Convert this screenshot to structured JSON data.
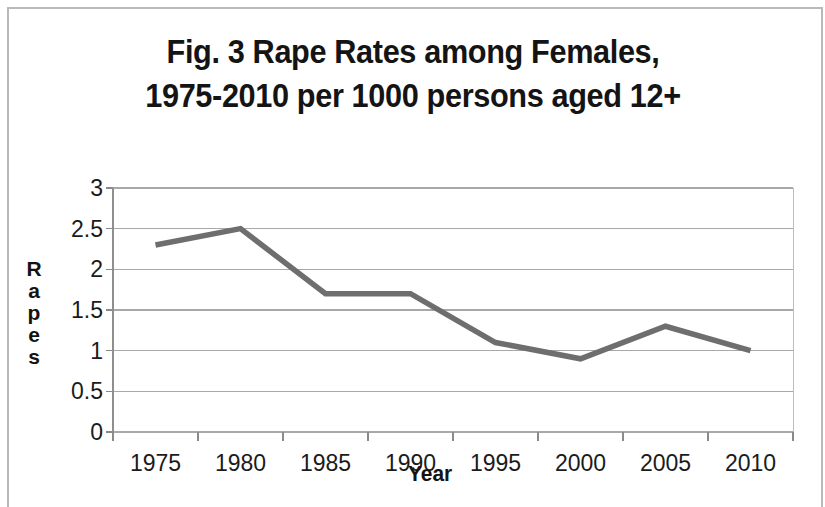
{
  "figure": {
    "title_line1": "Fig. 3 Rape Rates among Females,",
    "title_line2": "1975-2010 per 1000 persons aged 12+",
    "title_full": "Fig. 3 Rape Rates among Females,\n1975-2010 per 1000 persons aged 12+"
  },
  "axis": {
    "y_title_letters": [
      "R",
      "a",
      "p",
      "e",
      "s"
    ],
    "y_title": "Rapes",
    "x_title": "Year"
  },
  "chart_data": {
    "type": "line",
    "title": "Fig. 3 Rape Rates among Females, 1975-2010 per 1000 persons aged 12+",
    "xlabel": "Year",
    "ylabel": "Rapes",
    "categories": [
      "1975",
      "1980",
      "1985",
      "1990",
      "1995",
      "2000",
      "2005",
      "2010"
    ],
    "values": [
      2.3,
      2.5,
      1.7,
      1.7,
      1.1,
      0.9,
      1.3,
      1.0
    ],
    "ylim": [
      0,
      3
    ],
    "yticks": [
      "0",
      "0.5",
      "1",
      "1.5",
      "2",
      "2.5",
      "3"
    ],
    "ytick_values": [
      0,
      0.5,
      1,
      1.5,
      2,
      2.5,
      3
    ],
    "grid": "horizontal",
    "legend": "none",
    "line_color": "#6e6e6e",
    "grid_color": "#a8a8a8"
  }
}
